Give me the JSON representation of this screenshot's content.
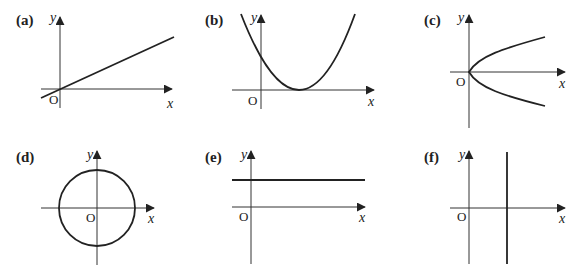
{
  "figure": {
    "colors": {
      "ink": "#222222",
      "background": "#ffffff"
    },
    "panels": [
      {
        "id": "a",
        "label": "(a)",
        "graph": "straight line with positive gradient through origin",
        "x_label": "x",
        "y_label": "y",
        "origin_label": "O"
      },
      {
        "id": "b",
        "label": "(b)",
        "graph": "U-shaped parabola touching x-axis at positive x",
        "x_label": "x",
        "y_label": "y",
        "origin_label": "O"
      },
      {
        "id": "c",
        "label": "(c)",
        "graph": "sideways parabola opening right with vertex at origin",
        "x_label": "x",
        "y_label": "y",
        "origin_label": "O"
      },
      {
        "id": "d",
        "label": "(d)",
        "graph": "circle centred at origin",
        "x_label": "x",
        "y_label": "y",
        "origin_label": "O"
      },
      {
        "id": "e",
        "label": "(e)",
        "graph": "horizontal line above x-axis",
        "x_label": "x",
        "y_label": "y",
        "origin_label": "O"
      },
      {
        "id": "f",
        "label": "(f)",
        "graph": "vertical line right of y-axis",
        "x_label": "x",
        "y_label": "y",
        "origin_label": "O"
      }
    ]
  }
}
